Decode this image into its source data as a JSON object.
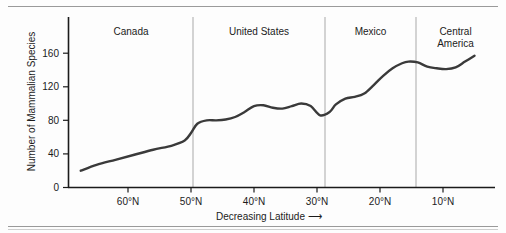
{
  "chart_data": {
    "type": "line",
    "title": "",
    "xlabel": "Decreasing Latitude",
    "xlabel_arrow": "⟶",
    "ylabel": "Number of Mammalian Species",
    "xlim": [
      68,
      4
    ],
    "ylim": [
      0,
      180
    ],
    "grid": false,
    "legend": null,
    "y_ticks": [
      0,
      40,
      80,
      120,
      160
    ],
    "y_tick_labels": [
      "0",
      "40",
      "80",
      "120",
      "160"
    ],
    "x_ticks": [
      60,
      50,
      40,
      30,
      20,
      10
    ],
    "x_tick_labels": [
      "60°N",
      "50°N",
      "40°N",
      "30°N",
      "20°N",
      "10°N"
    ],
    "region_dividers": [
      49,
      29.5
    ],
    "regions": [
      {
        "label": "Canada",
        "start": 68,
        "end": 49
      },
      {
        "label": "United States",
        "start": 49,
        "end": 29.5
      },
      {
        "label": "Mexico",
        "start": 29.5,
        "end": 15.5
      },
      {
        "label": "Central America",
        "label_line1": "Central",
        "label_line2": "America",
        "start": 15.5,
        "end": 4
      }
    ],
    "series": [
      {
        "name": "Number of Mammalian Species",
        "color": "#3a3a3a",
        "x": [
          67.5,
          65,
          62,
          59,
          56,
          53,
          51,
          50,
          49,
          47.5,
          46,
          44.5,
          43,
          41.5,
          40,
          38.5,
          37,
          35.5,
          34,
          32.5,
          31,
          29.5,
          28,
          27,
          25.5,
          24,
          22.5,
          21,
          19.5,
          18,
          16.5,
          15.5,
          14,
          12.5,
          11,
          9.5,
          8,
          6.5,
          5
        ],
        "y": [
          20,
          27,
          33,
          39,
          45,
          50,
          56,
          65,
          76,
          80,
          80,
          81,
          84,
          90,
          97,
          98,
          95,
          94,
          97,
          100,
          97,
          86,
          90,
          99,
          106,
          108,
          112,
          122,
          133,
          142,
          148,
          150,
          149,
          144,
          142,
          141,
          143,
          150,
          157
        ]
      }
    ],
    "annotations": []
  }
}
